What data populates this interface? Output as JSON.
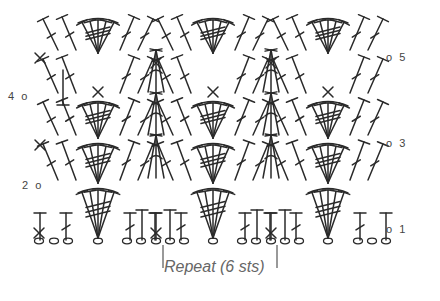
{
  "diagram": {
    "type": "crochet-stitch-chart",
    "pattern": "fan / shell stitch",
    "row_labels": {
      "left": [
        {
          "text": "4",
          "x": 8,
          "y": 97
        },
        {
          "text": "2",
          "x": 22,
          "y": 186
        }
      ],
      "right": [
        {
          "text": "5",
          "x": 400,
          "y": 58
        },
        {
          "text": "3",
          "x": 400,
          "y": 144
        },
        {
          "text": "1",
          "x": 400,
          "y": 230
        }
      ]
    },
    "repeat": {
      "label": "Repeat (6 sts)",
      "bracket_left_x": 163,
      "bracket_right_x": 277
    },
    "foundation_chain_x": [
      39,
      54,
      68,
      98,
      127,
      141,
      156,
      170,
      184,
      213,
      242,
      256,
      271,
      285,
      299,
      328,
      358,
      372,
      386
    ],
    "fan_centers_x": [
      98,
      213,
      328
    ],
    "mid_centers_x": [
      156,
      271
    ],
    "sc_bottom_x": [
      39,
      156,
      271
    ],
    "legend": {
      "chain": "o",
      "single_crochet": "×",
      "double_crochet": "T with slash",
      "treble_group": "fan of T stitches"
    }
  }
}
